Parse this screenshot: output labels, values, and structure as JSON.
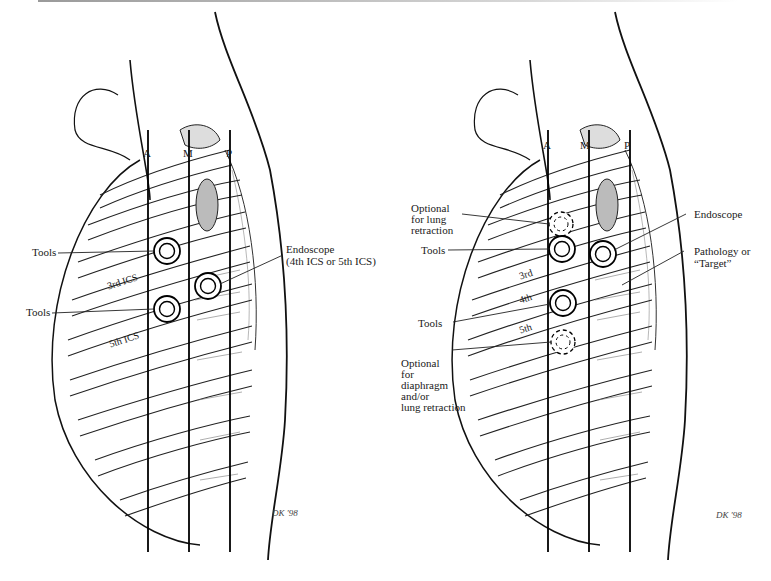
{
  "figure": {
    "left_panel": {
      "axis_lines": [
        "A",
        "M",
        "P"
      ],
      "labels": {
        "tools_upper": "Tools",
        "tools_lower": "Tools",
        "ics_3": "3rd ICS",
        "ics_5": "5th ICS",
        "endoscope_line1": "Endoscope",
        "endoscope_line2": "(4th ICS or 5th ICS)"
      },
      "ports": [
        {
          "role": "tools",
          "style": "solid",
          "ics": "3rd"
        },
        {
          "role": "tools",
          "style": "solid",
          "ics": "5th"
        },
        {
          "role": "endoscope",
          "style": "solid",
          "ics": "4th or 5th"
        }
      ],
      "signature": "DK '98"
    },
    "right_panel": {
      "axis_lines": [
        "A",
        "M",
        "P"
      ],
      "labels": {
        "optional_lung_1": "Optional",
        "optional_lung_2": "for lung",
        "optional_lung_3": "retraction",
        "tools_upper": "Tools",
        "tools_lower": "Tools",
        "ics_3": "3rd",
        "ics_4": "4th",
        "ics_5": "5th",
        "endoscope": "Endoscope",
        "pathology_1": "Pathology or",
        "pathology_2": "“Target”",
        "optional_diaphragm_1": "Optional",
        "optional_diaphragm_2": "for",
        "optional_diaphragm_3": "diaphragm",
        "optional_diaphragm_4": "and/or",
        "optional_diaphragm_5": "lung retraction"
      },
      "ports": [
        {
          "role": "optional lung retraction",
          "style": "dashed"
        },
        {
          "role": "tools",
          "style": "solid",
          "ics": "3rd"
        },
        {
          "role": "endoscope",
          "style": "solid"
        },
        {
          "role": "tools",
          "style": "solid",
          "ics": "4th/5th"
        },
        {
          "role": "optional diaphragm/lung retraction",
          "style": "dashed"
        }
      ],
      "signature": "DK '98"
    },
    "colors": {
      "ink": "#1a1a1a",
      "background": "#ffffff",
      "shade": "#8a8a8a"
    }
  }
}
